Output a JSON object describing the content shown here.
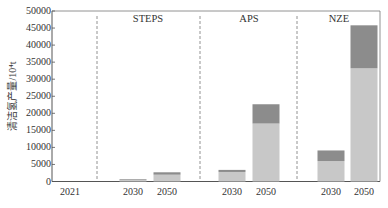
{
  "chart_data": {
    "type": "bar",
    "stacked": true,
    "title": "",
    "xlabel": "",
    "ylabel": "清洁氢产量/10⁴t",
    "ylim": [
      0,
      50000
    ],
    "yticks": [
      0,
      5000,
      10000,
      15000,
      20000,
      25000,
      30000,
      35000,
      40000,
      45000,
      50000
    ],
    "grid": false,
    "legend": null,
    "groups": [
      {
        "name": "",
        "categories": [
          "2021"
        ]
      },
      {
        "name": "STEPS",
        "categories": [
          "2030",
          "2050"
        ]
      },
      {
        "name": "APS",
        "categories": [
          "2030",
          "2050"
        ]
      },
      {
        "name": "NZE",
        "categories": [
          "2030",
          "2050"
        ]
      }
    ],
    "categories": [
      "2021",
      "STEPS 2030",
      "STEPS 2050",
      "APS 2030",
      "APS 2050",
      "NZE 2030",
      "NZE 2050"
    ],
    "series": [
      {
        "name": "lower segment (light gray)",
        "color": "#c8c8c8",
        "values": [
          0,
          500,
          2000,
          2800,
          17000,
          6000,
          33200
        ]
      },
      {
        "name": "upper segment (dark gray)",
        "color": "#8c8c8c",
        "values": [
          0,
          200,
          700,
          600,
          5650,
          3100,
          12600
        ]
      }
    ],
    "totals": [
      0,
      700,
      2700,
      3400,
      22650,
      9100,
      45800
    ],
    "annotations": [
      "STEPS",
      "APS",
      "NZE"
    ],
    "dividers": "dashed vertical lines separating 2021 | STEPS | APS | NZE"
  },
  "axis": {
    "ylabel": "清洁氢产量/10⁴t",
    "yticks": [
      "0",
      "5000",
      "10000",
      "15000",
      "20000",
      "25000",
      "30000",
      "35000",
      "40000",
      "45000",
      "50000"
    ]
  },
  "scenarios": {
    "steps": "STEPS",
    "aps": "APS",
    "nze": "NZE"
  },
  "xlabels": {
    "base": "2021",
    "steps_2030": "2030",
    "steps_2050": "2050",
    "aps_2030": "2030",
    "aps_2050": "2050",
    "nze_2030": "2030",
    "nze_2050": "2050"
  },
  "colors": {
    "lower": "#c8c8c8",
    "upper": "#8c8c8c",
    "axis": "#555555",
    "divider": "#777777"
  }
}
